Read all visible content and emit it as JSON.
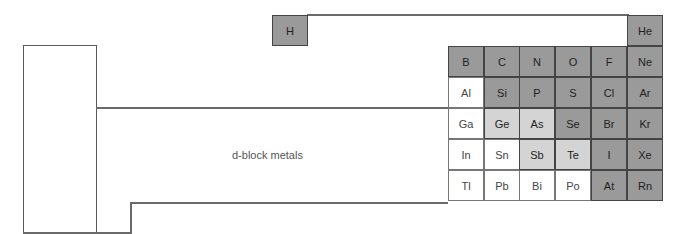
{
  "diagram": {
    "d_block_label": "d-block metals",
    "colors": {
      "nonmetal": "#9a9a9a",
      "metalloid": "#d4d4d4",
      "metal": "#ffffff",
      "line": "#5a5a5a"
    },
    "hydrogen": {
      "symbol": "H",
      "type": "nonmetal"
    },
    "p_block": [
      [
        {
          "symbol": "",
          "type": "empty"
        },
        {
          "symbol": "",
          "type": "empty"
        },
        {
          "symbol": "",
          "type": "empty"
        },
        {
          "symbol": "",
          "type": "empty"
        },
        {
          "symbol": "",
          "type": "empty"
        },
        {
          "symbol": "He",
          "type": "nonmetal"
        }
      ],
      [
        {
          "symbol": "B",
          "type": "nonmetal"
        },
        {
          "symbol": "C",
          "type": "nonmetal"
        },
        {
          "symbol": "N",
          "type": "nonmetal"
        },
        {
          "symbol": "O",
          "type": "nonmetal"
        },
        {
          "symbol": "F",
          "type": "nonmetal"
        },
        {
          "symbol": "Ne",
          "type": "nonmetal"
        }
      ],
      [
        {
          "symbol": "Al",
          "type": "metal"
        },
        {
          "symbol": "Si",
          "type": "nonmetal"
        },
        {
          "symbol": "P",
          "type": "nonmetal"
        },
        {
          "symbol": "S",
          "type": "nonmetal"
        },
        {
          "symbol": "Cl",
          "type": "nonmetal"
        },
        {
          "symbol": "Ar",
          "type": "nonmetal"
        }
      ],
      [
        {
          "symbol": "Ga",
          "type": "metal"
        },
        {
          "symbol": "Ge",
          "type": "semi"
        },
        {
          "symbol": "As",
          "type": "semi"
        },
        {
          "symbol": "Se",
          "type": "nonmetal"
        },
        {
          "symbol": "Br",
          "type": "nonmetal"
        },
        {
          "symbol": "Kr",
          "type": "nonmetal"
        }
      ],
      [
        {
          "symbol": "In",
          "type": "metal"
        },
        {
          "symbol": "Sn",
          "type": "metal"
        },
        {
          "symbol": "Sb",
          "type": "semi"
        },
        {
          "symbol": "Te",
          "type": "semi"
        },
        {
          "symbol": "I",
          "type": "nonmetal"
        },
        {
          "symbol": "Xe",
          "type": "nonmetal"
        }
      ],
      [
        {
          "symbol": "Tl",
          "type": "metal"
        },
        {
          "symbol": "Pb",
          "type": "metal"
        },
        {
          "symbol": "Bi",
          "type": "metal"
        },
        {
          "symbol": "Po",
          "type": "metal"
        },
        {
          "symbol": "At",
          "type": "nonmetal"
        },
        {
          "symbol": "Rn",
          "type": "nonmetal"
        }
      ]
    ]
  }
}
